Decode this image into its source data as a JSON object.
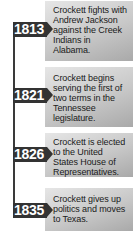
{
  "timeline": {
    "events": [
      {
        "year": "1813",
        "text": "Crockett fights with Andrew Jackson against the Creek Indians in Alabama."
      },
      {
        "year": "1821",
        "text": "Crockett begins serving the first of two terms in the Tennessee legislature."
      },
      {
        "year": "1826",
        "text": "Crockett is elected to the United States House of Representatives."
      },
      {
        "year": "1835",
        "text": "Crockett gives up politics and moves to Texas."
      }
    ],
    "colors": {
      "badge": "#333333",
      "badge_text": "#ffffff",
      "line": "#3a3a3a",
      "box_light": "#e6e6e6",
      "box_dark": "#a9a9a9"
    }
  }
}
